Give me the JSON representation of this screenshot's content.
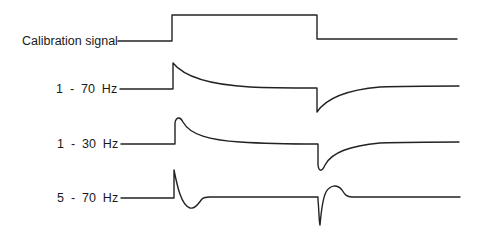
{
  "figure": {
    "traces": [
      {
        "label": "Calibration signal",
        "label_x": 22,
        "label_y": 35,
        "path": "M118,41 L172,41 L172,15 L317,15 L317,39 L457,39"
      },
      {
        "label": "1  -  70  Hz",
        "label_x": 56,
        "label_y": 83,
        "path": "M120,89 L173,89 L173,63 C185,78 215,85 250,87 C270,88 290,88 317,88 L317,112 C325,100 345,90 380,87 C405,86 430,86 459,86"
      },
      {
        "label": "1  -  30  Hz",
        "label_x": 57,
        "label_y": 138,
        "path": "M121,144 L175,144 L175,123 C176,117 180,116 183,122 C190,135 210,140 240,142 C270,144 300,144 318,144 L318,165 C319,172 322,172 325,165 C332,152 350,146 380,143 C410,142 435,142 459,142"
      },
      {
        "label": "5  -  70  Hz",
        "label_x": 57,
        "label_y": 192,
        "path": "M121,198 L174,198 L174,170 C177,185 181,205 190,208 C195,209 198,204 202,199 C204,197 207,197 210,197 L318,197 L318,200 C319,210 319,222 320,225 C321,215 322,200 326,192 C330,185 337,184 342,190 C345,195 347,197 352,197 L460,197"
      }
    ]
  },
  "colors": {
    "line": "#222222",
    "text": "#1a1a1a",
    "background": "#ffffff"
  }
}
